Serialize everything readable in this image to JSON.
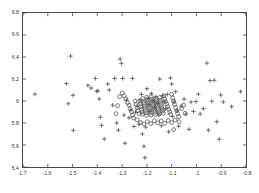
{
  "chart_data": {
    "type": "scatter",
    "title": "",
    "xlabel": "",
    "ylabel": "",
    "xlim": [
      -1.7,
      -0.8
    ],
    "ylim": [
      5.4,
      6.8
    ],
    "xticks": [
      -1.7,
      -1.6,
      -1.5,
      -1.4,
      -1.3,
      -1.2,
      -1.1,
      -1.0,
      -0.9,
      -0.8
    ],
    "yticks": [
      5.4,
      5.6,
      5.8,
      6.0,
      6.2,
      6.4,
      6.6,
      6.8
    ],
    "xticklabels": [
      "-1.7",
      "-1.6",
      "-1.5",
      "-1.4",
      "-1.3",
      "-1.2",
      "-1.1",
      "-1",
      "-0.9",
      "-0.8"
    ],
    "yticklabels": [
      "5.4",
      "5.6",
      "5.8",
      "6",
      "6.2",
      "6.4",
      "6.6",
      "6.8"
    ],
    "grid": false,
    "legend": null,
    "tick_direction": "in",
    "marker_color": "#4d4d4d",
    "axis_color": "#4a4a4a",
    "background_color": "#ffffff",
    "series": [
      {
        "name": "plus-markers",
        "marker": "plus",
        "color": "#4d4d4d",
        "points": [
          [
            -1.652,
            6.062
          ],
          [
            -1.525,
            6.158
          ],
          [
            -1.508,
            6.408
          ],
          [
            -1.517,
            5.975
          ],
          [
            -1.498,
            6.052
          ],
          [
            -1.497,
            5.733
          ],
          [
            -1.438,
            6.142
          ],
          [
            -1.425,
            6.118
          ],
          [
            -1.408,
            6.205
          ],
          [
            -1.402,
            6.088
          ],
          [
            -1.398,
            6.092
          ],
          [
            -1.392,
            6.018
          ],
          [
            -1.388,
            5.852
          ],
          [
            -1.383,
            5.779
          ],
          [
            -1.372,
            5.655
          ],
          [
            -1.358,
            6.155
          ],
          [
            -1.352,
            6.1
          ],
          [
            -1.338,
            5.962
          ],
          [
            -1.33,
            6.205
          ],
          [
            -1.322,
            5.8
          ],
          [
            -1.315,
            5.735
          ],
          [
            -1.308,
            6.382
          ],
          [
            -1.303,
            6.342
          ],
          [
            -1.298,
            6.205
          ],
          [
            -1.292,
            5.872
          ],
          [
            -1.288,
            5.616
          ],
          [
            -1.282,
            6.008
          ],
          [
            -1.272,
            5.848
          ],
          [
            -1.265,
            5.918
          ],
          [
            -1.258,
            6.205
          ],
          [
            -1.252,
            5.768
          ],
          [
            -1.246,
            5.898
          ],
          [
            -1.24,
            5.952
          ],
          [
            -1.232,
            5.788
          ],
          [
            -1.228,
            6.01
          ],
          [
            -1.222,
            6.06
          ],
          [
            -1.218,
            5.7
          ],
          [
            -1.212,
            5.588
          ],
          [
            -1.208,
            5.485
          ],
          [
            -1.205,
            5.762
          ],
          [
            -1.2,
            6.112
          ],
          [
            -1.196,
            6.022
          ],
          [
            -1.192,
            5.965
          ],
          [
            -1.188,
            5.908
          ],
          [
            -1.182,
            6.068
          ],
          [
            -1.176,
            5.998
          ],
          [
            -1.17,
            5.942
          ],
          [
            -1.164,
            6.038
          ],
          [
            -1.158,
            5.98
          ],
          [
            -1.152,
            5.872
          ],
          [
            -1.148,
            6.2
          ],
          [
            -1.142,
            5.775
          ],
          [
            -1.136,
            6.048
          ],
          [
            -1.13,
            5.992
          ],
          [
            -1.124,
            5.93
          ],
          [
            -1.118,
            6.06
          ],
          [
            -1.112,
            5.72
          ],
          [
            -1.105,
            6.208
          ],
          [
            -1.1,
            6.155
          ],
          [
            -1.096,
            5.86
          ],
          [
            -1.09,
            5.992
          ],
          [
            -1.084,
            6.085
          ],
          [
            -1.078,
            5.912
          ],
          [
            -1.072,
            5.77
          ],
          [
            -1.062,
            5.955
          ],
          [
            -1.05,
            6.018
          ],
          [
            -1.042,
            5.88
          ],
          [
            -1.03,
            5.742
          ],
          [
            -1.022,
            5.99
          ],
          [
            -1.012,
            5.905
          ],
          [
            -1.002,
            5.995
          ],
          [
            -0.992,
            6.062
          ],
          [
            -0.985,
            5.882
          ],
          [
            -0.972,
            5.93
          ],
          [
            -0.958,
            6.345
          ],
          [
            -0.952,
            5.735
          ],
          [
            -0.945,
            6.185
          ],
          [
            -0.938,
            5.998
          ],
          [
            -0.928,
            6.188
          ],
          [
            -0.918,
            5.812
          ],
          [
            -0.908,
            5.652
          ],
          [
            -0.902,
            6.055
          ],
          [
            -0.892,
            5.992
          ],
          [
            -0.858,
            5.948
          ],
          [
            -0.822,
            6.085
          ]
        ]
      },
      {
        "name": "circle-markers",
        "marker": "circle",
        "color": "#4d4d4d",
        "points": [
          [
            -1.3,
            6.072
          ],
          [
            -1.292,
            6.048
          ],
          [
            -1.285,
            6.02
          ],
          [
            -1.278,
            5.985
          ],
          [
            -1.272,
            5.962
          ],
          [
            -1.268,
            5.93
          ],
          [
            -1.262,
            5.902
          ],
          [
            -1.258,
            5.872
          ],
          [
            -1.254,
            5.845
          ],
          [
            -1.248,
            6.0
          ],
          [
            -1.244,
            5.968
          ],
          [
            -1.24,
            5.938
          ],
          [
            -1.236,
            5.912
          ],
          [
            -1.232,
            5.885
          ],
          [
            -1.228,
            5.998
          ],
          [
            -1.226,
            5.975
          ],
          [
            -1.224,
            5.948
          ],
          [
            -1.222,
            5.925
          ],
          [
            -1.22,
            5.9
          ],
          [
            -1.218,
            5.88
          ],
          [
            -1.216,
            6.022
          ],
          [
            -1.214,
            5.998
          ],
          [
            -1.212,
            5.978
          ],
          [
            -1.21,
            5.955
          ],
          [
            -1.208,
            5.935
          ],
          [
            -1.206,
            5.912
          ],
          [
            -1.204,
            5.892
          ],
          [
            -1.202,
            5.868
          ],
          [
            -1.2,
            6.035
          ],
          [
            -1.198,
            6.012
          ],
          [
            -1.196,
            5.992
          ],
          [
            -1.194,
            5.972
          ],
          [
            -1.192,
            5.952
          ],
          [
            -1.19,
            5.932
          ],
          [
            -1.188,
            5.912
          ],
          [
            -1.186,
            5.892
          ],
          [
            -1.184,
            5.872
          ],
          [
            -1.182,
            6.04
          ],
          [
            -1.18,
            6.018
          ],
          [
            -1.178,
            5.998
          ],
          [
            -1.176,
            5.978
          ],
          [
            -1.174,
            5.958
          ],
          [
            -1.172,
            5.938
          ],
          [
            -1.17,
            5.918
          ],
          [
            -1.168,
            5.898
          ],
          [
            -1.166,
            5.878
          ],
          [
            -1.164,
            6.022
          ],
          [
            -1.162,
            6.002
          ],
          [
            -1.16,
            5.982
          ],
          [
            -1.158,
            5.962
          ],
          [
            -1.156,
            5.942
          ],
          [
            -1.154,
            5.922
          ],
          [
            -1.152,
            5.902
          ],
          [
            -1.15,
            5.882
          ],
          [
            -1.148,
            6.032
          ],
          [
            -1.146,
            6.008
          ],
          [
            -1.144,
            5.988
          ],
          [
            -1.142,
            5.968
          ],
          [
            -1.14,
            5.948
          ],
          [
            -1.138,
            5.928
          ],
          [
            -1.136,
            5.908
          ],
          [
            -1.134,
            5.888
          ],
          [
            -1.132,
            6.048
          ],
          [
            -1.128,
            6.018
          ],
          [
            -1.124,
            5.995
          ],
          [
            -1.12,
            5.972
          ],
          [
            -1.116,
            5.948
          ],
          [
            -1.112,
            5.925
          ],
          [
            -1.108,
            5.9
          ],
          [
            -1.104,
            5.878
          ],
          [
            -1.1,
            6.062
          ],
          [
            -1.096,
            6.028
          ],
          [
            -1.092,
            5.998
          ],
          [
            -1.088,
            5.968
          ],
          [
            -1.084,
            5.94
          ],
          [
            -1.08,
            5.912
          ],
          [
            -1.076,
            5.885
          ],
          [
            -1.072,
            5.858
          ],
          [
            -1.24,
            5.828
          ],
          [
            -1.226,
            5.805
          ],
          [
            -1.212,
            5.79
          ],
          [
            -1.198,
            5.812
          ],
          [
            -1.184,
            5.795
          ],
          [
            -1.17,
            5.82
          ],
          [
            -1.156,
            5.802
          ],
          [
            -1.142,
            5.818
          ],
          [
            -1.128,
            5.798
          ],
          [
            -1.114,
            5.822
          ],
          [
            -1.1,
            5.805
          ],
          [
            -1.086,
            5.828
          ],
          [
            -1.07,
            5.812
          ],
          [
            -1.31,
            6.04
          ],
          [
            -1.318,
            5.958
          ],
          [
            -1.325,
            5.885
          ],
          [
            -1.06,
            5.93
          ],
          [
            -1.052,
            5.962
          ],
          [
            -1.046,
            5.888
          ],
          [
            -1.092,
            5.74
          ]
        ]
      }
    ]
  }
}
